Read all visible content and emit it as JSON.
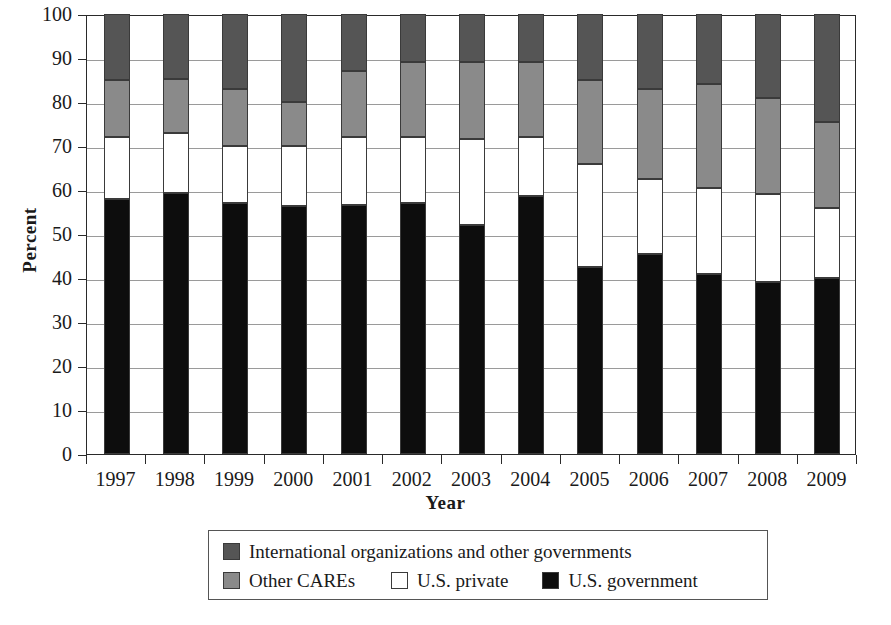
{
  "chart_data": {
    "type": "bar",
    "subtype": "stacked-bar-100-percent",
    "title": "",
    "xlabel": "Year",
    "ylabel": "Percent",
    "ylim": [
      0,
      100
    ],
    "ytick_step": 10,
    "yticks": [
      0,
      10,
      20,
      30,
      40,
      50,
      60,
      70,
      80,
      90,
      100
    ],
    "grid": true,
    "grid_axis": "y",
    "legend_position": "below-center",
    "categories": [
      "1997",
      "1998",
      "1999",
      "2000",
      "2001",
      "2002",
      "2003",
      "2004",
      "2005",
      "2006",
      "2007",
      "2008",
      "2009"
    ],
    "stack_order_bottom_to_top": [
      "U.S. government",
      "U.S. private",
      "Other CAREs",
      "International organizations and other governments"
    ],
    "series": [
      {
        "name": "U.S. government",
        "color": "#0d0d0d",
        "values": [
          58.0,
          59.3,
          57.0,
          56.3,
          56.5,
          57.0,
          52.0,
          58.7,
          42.5,
          45.5,
          41.0,
          39.0,
          40.0
        ]
      },
      {
        "name": "U.S. private",
        "color": "#ffffff",
        "values": [
          14.0,
          13.7,
          13.0,
          13.7,
          15.5,
          15.0,
          19.5,
          13.3,
          23.5,
          17.0,
          19.5,
          20.0,
          16.0
        ]
      },
      {
        "name": "Other CAREs",
        "color": "#8a8a8a",
        "values": [
          13.0,
          12.3,
          13.0,
          10.0,
          15.0,
          17.0,
          17.5,
          17.0,
          19.0,
          20.5,
          23.5,
          22.0,
          19.5
        ]
      },
      {
        "name": "International organizations and other governments",
        "color": "#555555",
        "values": [
          15.0,
          14.7,
          17.0,
          20.0,
          13.0,
          11.0,
          11.0,
          11.0,
          15.0,
          17.0,
          16.0,
          19.0,
          24.5
        ]
      }
    ],
    "cumulative_tops": {
      "1997": [
        58.0,
        72.0,
        85.0,
        100
      ],
      "1998": [
        59.3,
        73.0,
        85.3,
        100
      ],
      "1999": [
        57.0,
        70.0,
        83.0,
        100
      ],
      "2000": [
        56.3,
        70.0,
        80.0,
        100
      ],
      "2001": [
        56.5,
        72.0,
        87.0,
        100
      ],
      "2002": [
        57.0,
        72.0,
        89.0,
        100
      ],
      "2003": [
        52.0,
        71.5,
        89.0,
        100
      ],
      "2004": [
        58.7,
        72.0,
        89.0,
        100
      ],
      "2005": [
        42.5,
        66.0,
        85.0,
        100
      ],
      "2006": [
        45.5,
        62.5,
        83.0,
        100
      ],
      "2007": [
        41.0,
        60.5,
        84.0,
        100
      ],
      "2008": [
        39.0,
        59.0,
        81.0,
        100
      ],
      "2009": [
        40.0,
        56.0,
        75.5,
        100
      ]
    }
  },
  "axes": {
    "y_title": "Percent",
    "x_title": "Year"
  },
  "legend": {
    "row1": [
      {
        "label": "International organizations and other governments",
        "swatch": "dark-gray-swatch",
        "color": "#555555"
      }
    ],
    "row2": [
      {
        "label": "Other CAREs",
        "swatch": "medium-gray-swatch",
        "color": "#8a8a8a"
      },
      {
        "label": "U.S. private",
        "swatch": "white-swatch",
        "color": "#ffffff"
      },
      {
        "label": "U.S. government",
        "swatch": "black-swatch",
        "color": "#0d0d0d"
      }
    ]
  }
}
